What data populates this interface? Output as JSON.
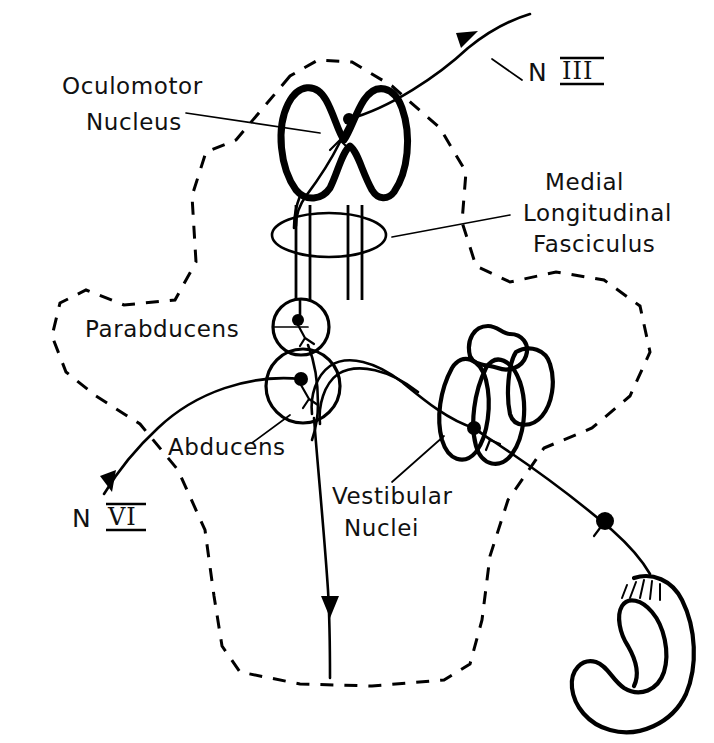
{
  "figure": {
    "background_color": "#ffffff",
    "ink_color": "#000000",
    "width": 714,
    "height": 743
  },
  "labels": {
    "oculomotor_line1": "Oculomotor",
    "oculomotor_line2": "Nucleus",
    "nerve_three_prefix": "N",
    "nerve_three_numeral": "III",
    "mlf_line1": "Medial",
    "mlf_line2": "Longitudinal",
    "mlf_line3": "Fasciculus",
    "parabducens": "Parabducens",
    "abducens": "Abducens",
    "nerve_six_prefix": "N",
    "nerve_six_numeral": "VI",
    "vestibular_line1": "Vestibular",
    "vestibular_line2": "Nuclei"
  },
  "structures": [
    {
      "name": "oculomotor-nucleus",
      "kind": "nucleus-outline",
      "description": "Thick bilobed W-shaped nucleus outline in the midbrain"
    },
    {
      "name": "medial-longitudinal-fasciculus",
      "kind": "ellipse-with-tracts",
      "description": "Horizontal ellipse crossed by four vertical fiber lines"
    },
    {
      "name": "parabducens-nucleus",
      "kind": "circle",
      "description": "Small circle above the abducens nucleus"
    },
    {
      "name": "abducens-nucleus",
      "kind": "circle",
      "description": "Larger circle below the parabducens nucleus"
    },
    {
      "name": "vestibular-nuclei",
      "kind": "blob-cluster",
      "description": "Cluster of lobed nuclei in the lateral pons"
    },
    {
      "name": "semicircular-canal",
      "kind": "labyrinth",
      "description": "C-shaped semicircular canal with ampulla and hair cell bristles"
    },
    {
      "name": "brainstem-outline",
      "kind": "dashed-silhouette",
      "description": "Dashed outline of the brainstem and cerebellum"
    }
  ],
  "pathways": [
    {
      "name": "oculomotor-nerve",
      "label": "N III",
      "direction": "exits up and to the right with arrowhead"
    },
    {
      "name": "abducens-nerve",
      "label": "N VI",
      "direction": "exits down and to the left with arrowhead"
    },
    {
      "name": "vestibulospinal-tract",
      "direction": "descends to the bottom with arrowhead"
    },
    {
      "name": "vestibulo-abducens-fiber",
      "direction": "arches from vestibular nuclei to abducens nucleus"
    },
    {
      "name": "mlf-ascending-fiber",
      "direction": "ascends from parabducens to oculomotor nucleus"
    },
    {
      "name": "vestibular-nerve-afferent",
      "direction": "runs from semicircular canal to vestibular nuclei"
    }
  ]
}
